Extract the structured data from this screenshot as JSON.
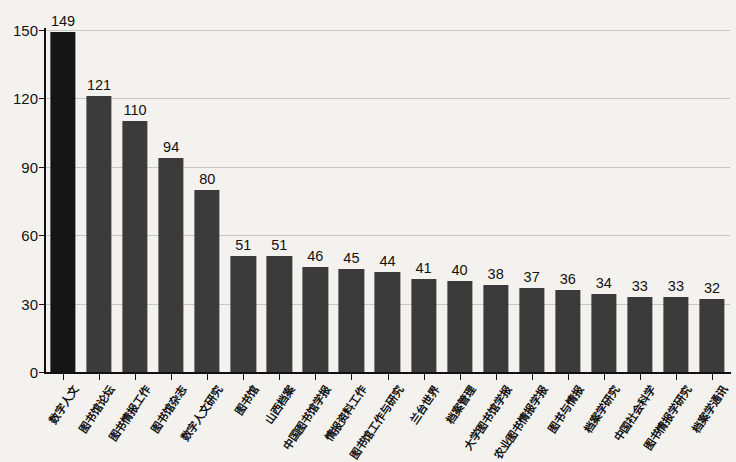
{
  "chart_data": {
    "type": "bar",
    "title": "",
    "subtitle": "",
    "xlabel": "",
    "ylabel": "",
    "ylim": [
      0,
      150
    ],
    "yticks": [
      "0",
      "30",
      "60",
      "90",
      "120",
      "150"
    ],
    "ytick_values": [
      0,
      30,
      60,
      90,
      120,
      150
    ],
    "grid": true,
    "grid_axis": "y",
    "legend": "none",
    "bar_color": "#3b3b3b",
    "first_bar_color": "#151515",
    "background_color": "#f4f2ef",
    "axis_color": "#111111",
    "categories": [
      "数字人文",
      "图书馆论坛",
      "图书情报工作",
      "图书馆杂志",
      "数字人文研究",
      "图书馆",
      "山西档案",
      "中国图书馆学报",
      "情报资料工作",
      "图书馆工作与研究",
      "兰台世界",
      "档案管理",
      "大学图书馆学报",
      "农业图书情报学报",
      "图书与情报",
      "档案学研究",
      "中国社会科学",
      "图书情报学研究",
      "档案学通讯"
    ],
    "values": [
      149,
      121,
      110,
      94,
      80,
      51,
      51,
      46,
      45,
      44,
      41,
      40,
      38,
      37,
      36,
      34,
      33,
      33,
      32
    ],
    "data_labels": [
      "149",
      "121",
      "110",
      "94",
      "80",
      "51",
      "51",
      "46",
      "45",
      "44",
      "41",
      "40",
      "38",
      "37",
      "36",
      "34",
      "33",
      "33",
      "32"
    ]
  }
}
